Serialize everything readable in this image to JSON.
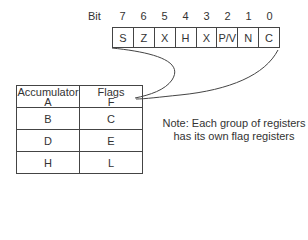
{
  "bit_header": {
    "label": "Bit",
    "numbers": [
      "7",
      "6",
      "5",
      "4",
      "3",
      "2",
      "1",
      "0"
    ]
  },
  "flag_register": {
    "bits": [
      "S",
      "Z",
      "X",
      "H",
      "X",
      "P/V",
      "N",
      "C"
    ]
  },
  "register_table": {
    "rows": [
      {
        "left": "Accumulator",
        "left_sub": "A",
        "right": "Flags",
        "right_sub": "F"
      },
      {
        "left": "B",
        "right": "C"
      },
      {
        "left": "D",
        "right": "E"
      },
      {
        "left": "H",
        "right": "L"
      }
    ]
  },
  "note": {
    "line1": "Note: Each group of registers",
    "line2": "has its own flag registers"
  }
}
